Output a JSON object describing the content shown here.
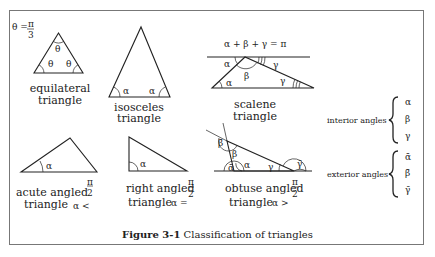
{
  "figure": {
    "caption_label": "Figure 3-1",
    "caption_text": "Classification of triangles"
  },
  "triangles": [
    {
      "id": "equilateral",
      "line1": "equilateral",
      "line2": "triangle",
      "note": "θ = π/3",
      "angle_labels": [
        "θ",
        "θ",
        "θ"
      ]
    },
    {
      "id": "isosceles",
      "line1": "isosceles",
      "line2": "triangle",
      "angle_labels": [
        "α",
        "α"
      ]
    },
    {
      "id": "scalene",
      "line1": "scalene",
      "line2": "triangle",
      "note": "α + β + γ = π",
      "angle_labels": [
        "α",
        "β",
        "γ",
        "α",
        "γ"
      ]
    },
    {
      "id": "acute",
      "line1": "acute angled",
      "line2": "triangle",
      "condition": "α < π/2",
      "angle_labels": [
        "α"
      ]
    },
    {
      "id": "right",
      "line1": "right angled",
      "line2": "triangle",
      "condition": "α = π/2",
      "angle_labels": [
        "α"
      ]
    },
    {
      "id": "obtuse",
      "line1": "obtuse angled",
      "line2": "triangle",
      "condition": "α > π/2",
      "angle_labels": [
        "ᾱ",
        "β̄",
        "β",
        "α",
        "γ",
        "γ̄"
      ]
    }
  ],
  "legend": {
    "interior_label": "interior angles",
    "interior_items": [
      "α",
      "β",
      "γ"
    ],
    "exterior_label": "exterior angles",
    "exterior_items": [
      "ᾱ",
      "β̄",
      "γ̄"
    ]
  },
  "text": {
    "theta_eq": "θ =",
    "pi": "π",
    "three": "3",
    "two": "2",
    "sum_eq": "α + β + γ = π",
    "acute_cond": "α <",
    "right_cond": "α =",
    "obtuse_cond": "α >"
  }
}
